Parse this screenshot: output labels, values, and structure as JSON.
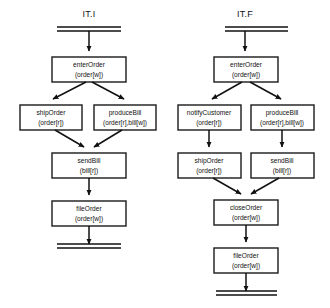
{
  "figure": {
    "background_color": "#ffffff",
    "line_color": "#111111",
    "node_fill": "#ffffff"
  },
  "diagrams": [
    {
      "id": "it-i",
      "title": "IT.I",
      "start_symbol": "double-bar",
      "end_symbol": "double-bar",
      "nodes": [
        {
          "id": "enterOrder",
          "name": "enterOrder",
          "params": "(order[w])"
        },
        {
          "id": "shipOrder",
          "name": "shipOrder",
          "params": "(order[r])"
        },
        {
          "id": "produceBill",
          "name": "produceBill",
          "params": "(order[r],bill[w])"
        },
        {
          "id": "sendBill",
          "name": "sendBill",
          "params": "(bill[r])"
        },
        {
          "id": "fileOrder",
          "name": "fileOrder",
          "params": "(order[w])"
        }
      ],
      "edges": [
        {
          "from": "start",
          "to": "enterOrder"
        },
        {
          "from": "enterOrder",
          "to": "shipOrder"
        },
        {
          "from": "enterOrder",
          "to": "produceBill"
        },
        {
          "from": "shipOrder",
          "to": "sendBill"
        },
        {
          "from": "produceBill",
          "to": "sendBill"
        },
        {
          "from": "sendBill",
          "to": "fileOrder"
        },
        {
          "from": "fileOrder",
          "to": "end"
        }
      ]
    },
    {
      "id": "it-f",
      "title": "IT.F",
      "start_symbol": "double-bar",
      "end_symbol": "double-bar",
      "nodes": [
        {
          "id": "enterOrder",
          "name": "enterOrder",
          "params": "(order[w])"
        },
        {
          "id": "notifyCustomer",
          "name": "notifyCustomer",
          "params": "(order[r])"
        },
        {
          "id": "produceBill",
          "name": "produceBill",
          "params": "(order[r],bill[w])"
        },
        {
          "id": "shipOrder",
          "name": "shipOrder",
          "params": "(order[r])"
        },
        {
          "id": "sendBill",
          "name": "sendBill",
          "params": "(bill[r])"
        },
        {
          "id": "closeOrder",
          "name": "closeOrder",
          "params": "(order[w])"
        },
        {
          "id": "fileOrder",
          "name": "fileOrder",
          "params": "(order[w])"
        }
      ],
      "edges": [
        {
          "from": "start",
          "to": "enterOrder"
        },
        {
          "from": "enterOrder",
          "to": "notifyCustomer"
        },
        {
          "from": "enterOrder",
          "to": "produceBill"
        },
        {
          "from": "notifyCustomer",
          "to": "shipOrder"
        },
        {
          "from": "produceBill",
          "to": "sendBill"
        },
        {
          "from": "shipOrder",
          "to": "closeOrder"
        },
        {
          "from": "sendBill",
          "to": "closeOrder"
        },
        {
          "from": "closeOrder",
          "to": "fileOrder"
        },
        {
          "from": "fileOrder",
          "to": "end"
        }
      ]
    }
  ]
}
